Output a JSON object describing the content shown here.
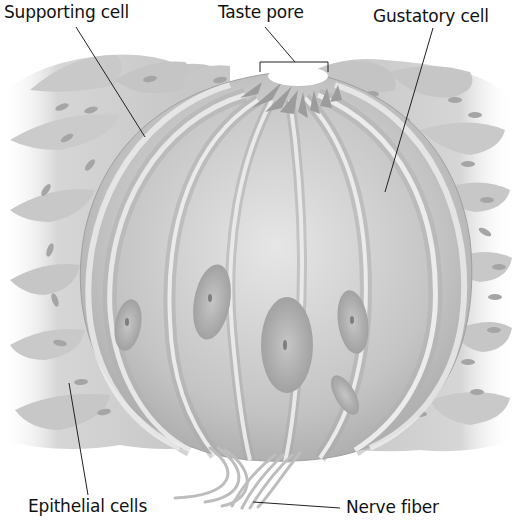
{
  "diagram": {
    "labels": {
      "supporting_cell": "Supporting cell",
      "taste_pore": "Taste pore",
      "gustatory_cell": "Gustatory cell",
      "epithelial_cells": "Epithelial cells",
      "nerve_fiber": "Nerve fiber"
    },
    "colors": {
      "background": "#ffffff",
      "tissue_light": "#e2e2e2",
      "tissue_mid": "#bdbdbd",
      "tissue_dark": "#9a9a9a",
      "nucleus": "#a8a8a8",
      "leader_line": "#222222",
      "label_text": "#111111"
    }
  }
}
